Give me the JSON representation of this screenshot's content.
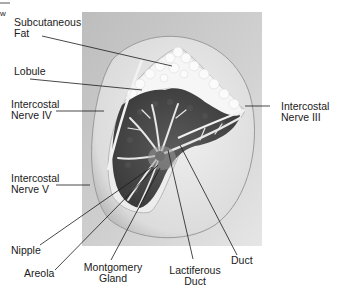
{
  "corner_fragment": "w",
  "labels": {
    "subcutaneous_fat": [
      "Subcutaneous",
      "Fat"
    ],
    "lobule": [
      "Lobule"
    ],
    "intercostal_nerve_iv": [
      "Intercostal",
      "Nerve IV"
    ],
    "intercostal_nerve_iii": [
      "Intercostal",
      "Nerve III"
    ],
    "intercostal_nerve_v": [
      "Intercostal",
      "Nerve V"
    ],
    "nipple": [
      "Nipple"
    ],
    "areola": [
      "Areola"
    ],
    "montgomery_gland": [
      "Montgomery",
      "Gland"
    ],
    "lactiferous_duct": [
      "Lactiferous",
      "Duct"
    ],
    "duct": [
      "Duct"
    ]
  },
  "colors": {
    "background_panel": "#c9c9c9",
    "breast_skin": "#e4e4e4",
    "fat": "#f2f2f2",
    "glandular_tissue": "#4a4a4a",
    "leader_line": "#1a1a1a"
  }
}
